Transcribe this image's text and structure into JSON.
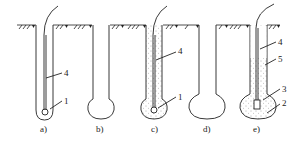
{
  "diagram": {
    "type": "borehole-stage-sequence",
    "colors": {
      "line": "#222222",
      "fill_dots": "#555555",
      "background": "#ffffff"
    },
    "stages": [
      {
        "id": "a",
        "label": "a)",
        "callouts": [
          "4",
          "1"
        ]
      },
      {
        "id": "b",
        "label": "b)",
        "callouts": []
      },
      {
        "id": "c",
        "label": "c)",
        "callouts": [
          "4",
          "1"
        ]
      },
      {
        "id": "d",
        "label": "d)",
        "callouts": []
      },
      {
        "id": "e",
        "label": "e)",
        "callouts": [
          "4",
          "5",
          "3",
          "2"
        ]
      }
    ]
  }
}
